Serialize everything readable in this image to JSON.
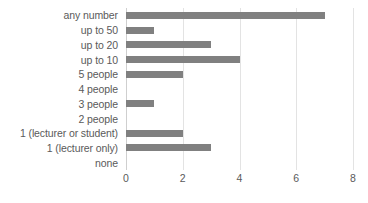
{
  "chart_data": {
    "type": "bar",
    "orientation": "horizontal",
    "title": "",
    "xlabel": "",
    "ylabel": "",
    "xlim": [
      0,
      8
    ],
    "xticks": [
      0,
      2,
      4,
      6,
      8
    ],
    "grid": true,
    "legend": false,
    "bar_color": "#808080",
    "text_color": "#5a5a5a",
    "gridline_color": "#e3e3e3",
    "categories": [
      "any number",
      "up to 50",
      "up to 20",
      "up to 10",
      "5 people",
      "4 people",
      "3 people",
      "2 people",
      "1 (lecturer or student)",
      "1 (lecturer only)",
      "none"
    ],
    "values": [
      7,
      1,
      3,
      4,
      2,
      0,
      1,
      0,
      2,
      3,
      0
    ]
  }
}
